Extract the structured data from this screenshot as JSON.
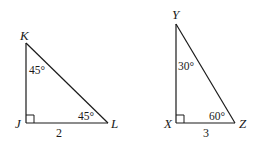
{
  "diagram": {
    "type": "two right triangles",
    "triangles": [
      {
        "name": "JKL",
        "vertices": {
          "K": {
            "label": "K",
            "x": 26,
            "y": 43
          },
          "J": {
            "label": "J",
            "x": 26,
            "y": 123
          },
          "L": {
            "label": "L",
            "x": 108,
            "y": 123
          }
        },
        "right_angle_at": "J",
        "angles": [
          {
            "at": "K",
            "label": "45°"
          },
          {
            "at": "L",
            "label": "45°"
          }
        ],
        "sides": [
          {
            "between": "J-L",
            "label": "2"
          }
        ]
      },
      {
        "name": "XYZ",
        "vertices": {
          "Y": {
            "label": "Y",
            "x": 176,
            "y": 24
          },
          "X": {
            "label": "X",
            "x": 176,
            "y": 123
          },
          "Z": {
            "label": "Z",
            "x": 235,
            "y": 123
          }
        },
        "right_angle_at": "X",
        "angles": [
          {
            "at": "Y",
            "label": "30°"
          },
          {
            "at": "Z",
            "label": "60°"
          }
        ],
        "sides": [
          {
            "between": "X-Z",
            "label": "3"
          }
        ]
      }
    ]
  }
}
